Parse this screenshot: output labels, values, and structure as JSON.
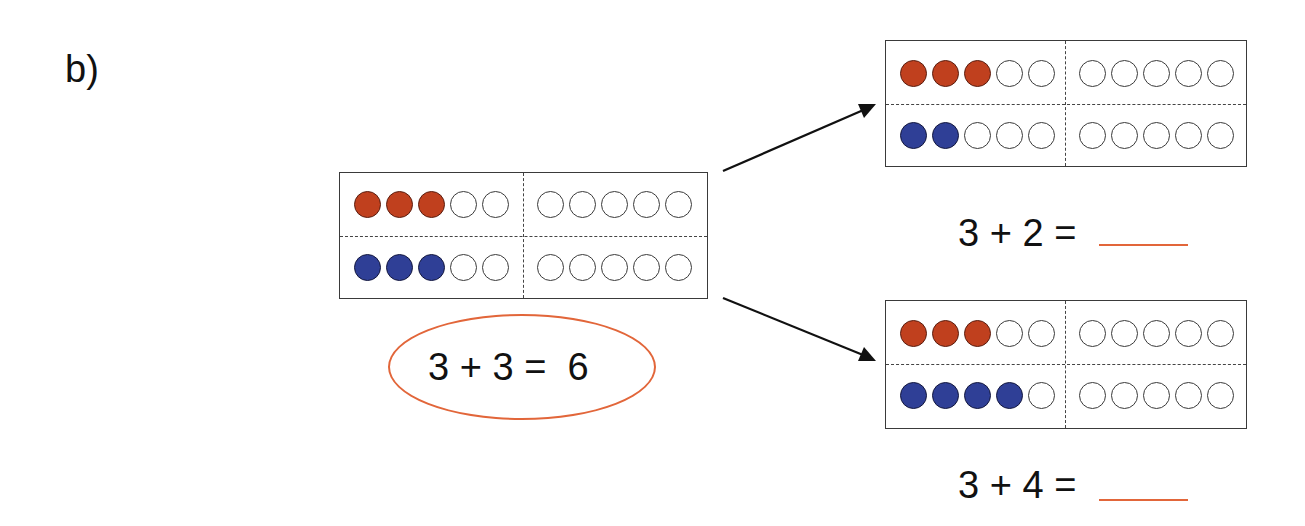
{
  "exercise": {
    "label": "b)"
  },
  "colors": {
    "red_counter": "#c0401e",
    "blue_counter": "#2f3f96",
    "empty_counter": "#ffffff",
    "highlight": "#e2663a",
    "frame_border": "#3a3a3a"
  },
  "frames": [
    {
      "id": "main",
      "top_row": {
        "filled": 3,
        "color": "red",
        "total": 10
      },
      "bottom_row": {
        "filled": 3,
        "color": "blue",
        "total": 10
      }
    },
    {
      "id": "upper-right",
      "top_row": {
        "filled": 3,
        "color": "red",
        "total": 10
      },
      "bottom_row": {
        "filled": 2,
        "color": "blue",
        "total": 10
      }
    },
    {
      "id": "lower-right",
      "top_row": {
        "filled": 3,
        "color": "red",
        "total": 10
      },
      "bottom_row": {
        "filled": 4,
        "color": "blue",
        "total": 10
      }
    }
  ],
  "equations": {
    "main": {
      "text": "3 + 3 =  6",
      "answer_circled": true
    },
    "upper_right": {
      "text": "3 + 2 =",
      "answer": ""
    },
    "lower_right": {
      "text": "3 + 4 =",
      "answer": ""
    }
  },
  "icons": {
    "arrow_up": "arrow-icon",
    "arrow_down": "arrow-icon"
  }
}
